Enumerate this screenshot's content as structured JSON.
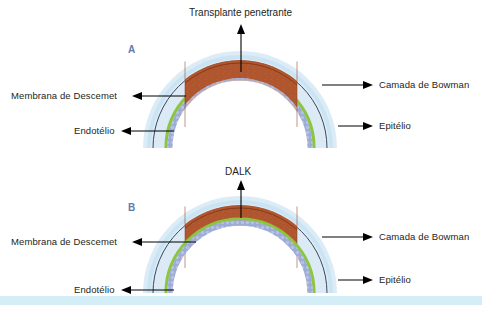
{
  "figure": {
    "caption_a_title": "Transplante penetrante",
    "caption_b_title": "DALK",
    "panel_a_letter": "A",
    "panel_b_letter": "B",
    "colors": {
      "graft_brown": "#b0562f",
      "graft_brown_dark": "#8f3f20",
      "descemet_green": "#8cc63e",
      "endothelium_blue": "#8e9ed0",
      "stroma_pale": "#d5e7f2",
      "epithelium_halo": "#cfe6f4",
      "bowman_line": "#3a4a5c",
      "panel_letter": "#5f7ab0",
      "text": "#231f20",
      "bottom_strip": "#d4eef8"
    }
  },
  "panels": [
    {
      "id": "panel-a",
      "letter": "A",
      "title": "Transplante penetrante",
      "labels_left": [
        {
          "name": "membrana-de-descemet",
          "text": "Membrana de Descemet"
        },
        {
          "name": "endotelio",
          "text": "Endotélio"
        }
      ],
      "labels_right": [
        {
          "name": "camada-de-bowman",
          "text": "Camada de Bowman"
        },
        {
          "name": "epitelio",
          "text": "Epitélio"
        }
      ]
    },
    {
      "id": "panel-b",
      "letter": "B",
      "title": "DALK",
      "labels_left": [
        {
          "name": "membrana-de-descemet",
          "text": "Membrana de Descemet"
        },
        {
          "name": "endotelio",
          "text": "Endotélio"
        }
      ],
      "labels_right": [
        {
          "name": "camada-de-bowman",
          "text": "Camada de Bowman"
        },
        {
          "name": "epitelio",
          "text": "Epitélio"
        }
      ]
    }
  ],
  "layers": {
    "epithelium": "Epitélio",
    "bowman": "Camada de Bowman",
    "descemet": "Membrana de Descemet",
    "endothelium": "Endotélio"
  }
}
